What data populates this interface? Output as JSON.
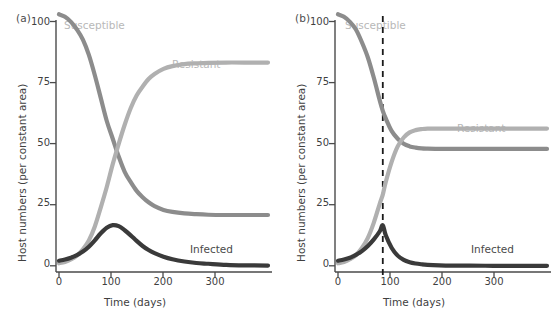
{
  "figure": {
    "background": "#ffffff",
    "panels": [
      {
        "id": "panel-a",
        "label": "(a)",
        "label_pos": {
          "x": 16,
          "y": 16
        }
      },
      {
        "id": "panel-b",
        "label": "(b)",
        "label_pos": {
          "x": 16,
          "y": 16
        }
      }
    ]
  },
  "colors": {
    "susceptible": "#8c8c8c",
    "resistant": "#b0b0b0",
    "infected": "#3a3a3a",
    "axis": "#4a4a4a",
    "text": "#3f3f3f",
    "label_susceptible": "#b8b8b8",
    "label_resistant": "#b8b8b8",
    "label_infected": "#4a4a4a",
    "dashed_line": "#1a1a1a"
  },
  "chart_data": [
    {
      "type": "line",
      "panel": "(a)",
      "title": "",
      "xlabel": "Time (days)",
      "ylabel": "Host numbers (per constant area)",
      "xlim": [
        0,
        350
      ],
      "ylim": [
        0,
        104
      ],
      "xticks": [
        0,
        100,
        200,
        300
      ],
      "xtick_labels": [
        "0",
        "100",
        "200",
        "300"
      ],
      "yticks": [
        0,
        25,
        50,
        75,
        100
      ],
      "ytick_labels": [
        "0",
        "25",
        "50",
        "75",
        "100"
      ],
      "grid": false,
      "legend": "inline-annotations",
      "annotations": [
        {
          "text": "Susceptible",
          "x": 30,
          "y": 100,
          "color_key": "label_susceptible"
        },
        {
          "text": "Resistant",
          "x": 205,
          "y": 88,
          "color_key": "label_resistant"
        },
        {
          "text": "Infected",
          "x": 225,
          "y": 10,
          "color_key": "label_infected"
        }
      ],
      "x": [
        0,
        10,
        20,
        30,
        40,
        50,
        60,
        70,
        80,
        90,
        100,
        110,
        120,
        130,
        140,
        150,
        160,
        175,
        190,
        210,
        230,
        250,
        280,
        310,
        350
      ],
      "series": [
        {
          "name": "Susceptible",
          "color_key": "susceptible",
          "values": [
            99,
            98,
            96,
            93,
            89,
            83,
            75,
            66,
            57,
            50,
            43,
            37,
            33,
            29.5,
            27,
            25,
            23.5,
            22,
            21.2,
            20.6,
            20.3,
            20.1,
            20,
            20,
            20
          ]
        },
        {
          "name": "Resistant",
          "color_key": "resistant",
          "values": [
            1,
            1.5,
            2.5,
            4,
            6.5,
            10,
            15.5,
            23,
            31,
            40,
            48,
            55.5,
            62,
            67,
            70.5,
            73.5,
            75.5,
            77.5,
            78.6,
            79.4,
            79.7,
            79.9,
            80,
            80,
            80
          ]
        },
        {
          "name": "Infected",
          "color_key": "infected",
          "values": [
            2,
            2.5,
            3.2,
            4.2,
            5.6,
            7.5,
            10,
            12.8,
            15,
            16,
            15.6,
            14,
            12,
            9.8,
            7.8,
            6.2,
            5,
            3.6,
            2.6,
            1.7,
            1.1,
            0.8,
            0.4,
            0.2,
            0.1
          ]
        }
      ],
      "vertical_lines": []
    },
    {
      "type": "line",
      "panel": "(b)",
      "title": "",
      "xlabel": "Time (days)",
      "ylabel": "Host numbers (per constant area)",
      "xlim": [
        0,
        350
      ],
      "ylim": [
        0,
        104
      ],
      "xticks": [
        0,
        100,
        200,
        300
      ],
      "xtick_labels": [
        "0",
        "100",
        "200",
        "300"
      ],
      "yticks": [
        0,
        25,
        50,
        75,
        100
      ],
      "ytick_labels": [
        "0",
        "25",
        "50",
        "75",
        "100"
      ],
      "grid": false,
      "legend": "inline-annotations",
      "annotations": [
        {
          "text": "Susceptible",
          "x": 32,
          "y": 100,
          "color_key": "label_susceptible"
        },
        {
          "text": "Resistant",
          "x": 215,
          "y": 61,
          "color_key": "label_resistant"
        },
        {
          "text": "Infected",
          "x": 228,
          "y": 10,
          "color_key": "label_infected"
        }
      ],
      "x": [
        0,
        10,
        20,
        30,
        40,
        50,
        60,
        70,
        75,
        80,
        90,
        100,
        110,
        120,
        130,
        140,
        150,
        170,
        190,
        220,
        260,
        300,
        350
      ],
      "series": [
        {
          "name": "Susceptible",
          "color_key": "susceptible",
          "values": [
            99,
            98,
            96,
            93,
            88,
            82,
            74,
            65,
            61,
            58,
            53,
            50,
            48,
            47,
            46.5,
            46.2,
            46.1,
            46,
            46,
            46,
            46,
            46,
            46
          ]
        },
        {
          "name": "Resistant",
          "color_key": "resistant",
          "values": [
            1,
            1.5,
            2.6,
            4.2,
            7,
            11,
            17,
            24.5,
            28,
            33,
            41,
            47,
            50.5,
            52.5,
            53.4,
            53.8,
            54,
            54,
            54,
            54,
            54,
            54,
            54
          ]
        },
        {
          "name": "Infected",
          "color_key": "infected",
          "values": [
            2,
            2.5,
            3.2,
            4.3,
            5.8,
            7.8,
            10.4,
            13.6,
            16,
            12,
            7,
            4,
            2.3,
            1.4,
            0.9,
            0.6,
            0.4,
            0.2,
            0.1,
            0.1,
            0,
            0,
            0
          ]
        }
      ],
      "vertical_lines": [
        {
          "x": 75,
          "style": "dashed",
          "color_key": "dashed_line",
          "label": ""
        }
      ]
    }
  ]
}
